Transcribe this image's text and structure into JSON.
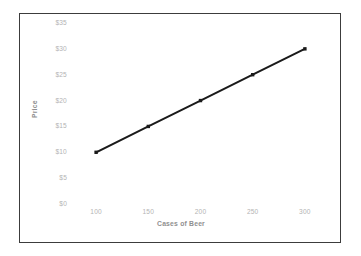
{
  "chart_data": {
    "type": "line",
    "title": "",
    "xlabel": "Cases of Beer",
    "ylabel": "Price",
    "x": [
      100,
      150,
      200,
      250,
      300
    ],
    "values": [
      10,
      15,
      20,
      25,
      30
    ],
    "series": [
      {
        "name": "Price",
        "values": [
          10,
          15,
          20,
          25,
          30
        ]
      }
    ],
    "x_tick_labels": [
      "100",
      "150",
      "200",
      "250",
      "300"
    ],
    "y_tick_labels": [
      "$0",
      "$5",
      "$10",
      "$15",
      "$20",
      "$25",
      "$30",
      "$35"
    ],
    "y_tick_values": [
      0,
      5,
      10,
      15,
      20,
      25,
      30,
      35
    ],
    "xlim": [
      75,
      325
    ],
    "ylim": [
      0,
      35
    ],
    "grid": false,
    "legend": false,
    "legend_position": "none",
    "marker": "square",
    "line_color": "#1a1a1a",
    "marker_color": "#1a1a1a",
    "tick_label_color": "#b4b4b4",
    "axis_title_color": "#8f8f8f",
    "frame_color": "#3c3c3c",
    "background_color": "#ffffff"
  }
}
